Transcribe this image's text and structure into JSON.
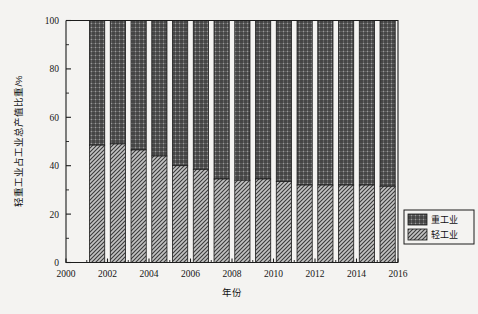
{
  "chart_data": {
    "type": "bar",
    "stacked": true,
    "title": "",
    "xlabel": "年份",
    "ylabel": "轻重工业占工业总产值比重/%",
    "categories": [
      2001,
      2002,
      2003,
      2004,
      2005,
      2006,
      2007,
      2008,
      2009,
      2010,
      2011,
      2012,
      2013,
      2014,
      2015
    ],
    "series": [
      {
        "name": "轻工业",
        "pattern": "diagonal-hatch",
        "values": [
          48.5,
          49.0,
          46.5,
          44.0,
          40.0,
          38.5,
          34.5,
          34.0,
          34.5,
          33.5,
          32.0,
          32.0,
          32.0,
          32.0,
          31.5
        ]
      },
      {
        "name": "重工业",
        "pattern": "crosshatch-grid",
        "values": [
          51.5,
          51.0,
          53.5,
          56.0,
          60.0,
          61.5,
          65.5,
          66.0,
          65.5,
          66.5,
          68.0,
          68.0,
          68.0,
          68.0,
          68.5
        ]
      }
    ],
    "xlim": [
      2000,
      2016
    ],
    "ylim": [
      0,
      100
    ],
    "xticks": [
      2000,
      2002,
      2004,
      2006,
      2008,
      2010,
      2012,
      2014,
      2016
    ],
    "xticklabels": [
      "2000",
      "2002",
      "2004",
      "2006",
      "2008",
      "2010",
      "2012",
      "2014",
      "2016"
    ],
    "yticks": [
      0,
      20,
      40,
      60,
      80,
      100
    ],
    "yticklabels": [
      "0",
      "20",
      "40",
      "60",
      "80",
      "100"
    ],
    "yminor": [
      10,
      30,
      50,
      70,
      90
    ],
    "grid": false,
    "legend_position": "right-outside-lower",
    "legend_entries": [
      "重工业",
      "轻工业"
    ]
  },
  "colors": {
    "background": "#f4f3f1",
    "axis": "#1c1c1c",
    "heavy_fill": "#8e8e8e",
    "light_fill": "#b9b9b9",
    "text": "#141414"
  }
}
